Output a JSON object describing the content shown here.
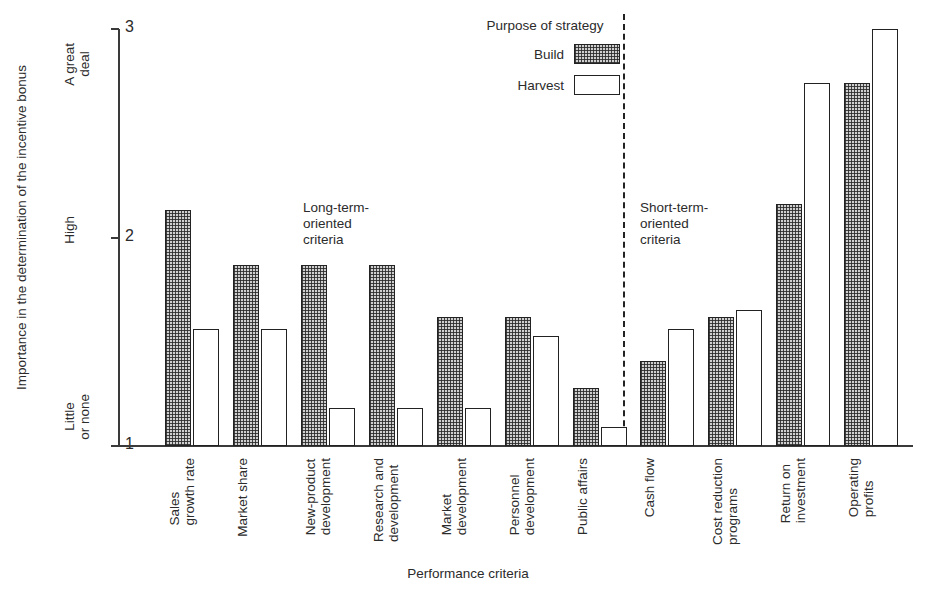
{
  "chart_data": {
    "type": "bar",
    "title": "",
    "xlabel": "Performance criteria",
    "ylabel": "Importance in the determination of the incentive bonus",
    "ylim": [
      1,
      3
    ],
    "yticks": [
      1,
      2,
      3
    ],
    "ytick_labels": [
      "1",
      "2",
      "3"
    ],
    "ytick_categories": [
      "Little\nor none",
      "High",
      "A great\ndeal"
    ],
    "grid": false,
    "legend_title": "Purpose of strategy",
    "legend_position": "top-center-right",
    "categories": [
      "Sales\ngrowth rate",
      "Market share",
      "New-product\ndevelopment",
      "Research and\ndevelopment",
      "Market\ndevelopment",
      "Personnel\ndevelopment",
      "Public affairs",
      "Cash flow",
      "Cost reduction\nprograms",
      "Return on\ninvestment",
      "Operating\nprofits"
    ],
    "series": [
      {
        "name": "Build",
        "fill": "hatched",
        "values": [
          2.13,
          1.87,
          1.87,
          1.87,
          1.62,
          1.62,
          1.28,
          1.41,
          1.62,
          2.16,
          2.74
        ]
      },
      {
        "name": "Harvest",
        "fill": "white",
        "values": [
          1.56,
          1.56,
          1.18,
          1.18,
          1.18,
          1.53,
          1.09,
          1.56,
          1.65,
          2.74,
          3.0
        ]
      }
    ],
    "annotations": [
      {
        "id": "long-term",
        "text": "Long-term-\noriented\ncriteria"
      },
      {
        "id": "short-term",
        "text": "Short-term-\noriented\ncriteria"
      }
    ],
    "divider": {
      "after_category_index": 6,
      "style": "dashed"
    },
    "colors": {
      "axis": "#3a3a3a",
      "bar_outline": "#222222",
      "build_fill": "#cfcfcf",
      "harvest_fill": "#ffffff",
      "text": "#2b2b2b",
      "background": "#ffffff"
    }
  }
}
